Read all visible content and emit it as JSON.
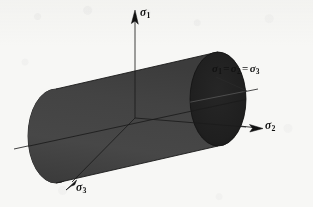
{
  "figure": {
    "name": "von-mises-yield-surface",
    "background_color": "#f7f7f5",
    "ink_color": "#121212",
    "cylinder_body_color": "#434343",
    "cylinder_endcap_color": "#1d1d1d",
    "cylinder_edge_color": "#1a1a1a"
  },
  "labels": {
    "sigma1": {
      "symbol": "σ",
      "subscript": "1"
    },
    "sigma2": {
      "symbol": "σ",
      "subscript": "2"
    },
    "sigma3": {
      "symbol": "σ",
      "subscript": "3"
    },
    "hydrostatic": {
      "symbol": "σ",
      "sub_a": "1",
      "eq1": "=",
      "sub_b": "2",
      "eq2": "=",
      "sub_c": "3",
      "text": "σ1 = σ2 = σ3"
    }
  },
  "geometry": {
    "origin": {
      "x": 135,
      "y": 118
    },
    "axis_sigma1": {
      "from": {
        "x": 135,
        "y": 118
      },
      "to": {
        "x": 135,
        "y": 12
      },
      "arrow": "up"
    },
    "axis_sigma2": {
      "from": {
        "x": 135,
        "y": 118
      },
      "to": {
        "x": 259,
        "y": 127
      },
      "arrow": "right"
    },
    "axis_sigma3": {
      "from": {
        "x": 135,
        "y": 118
      },
      "to": {
        "x": 68,
        "y": 186
      },
      "arrow": "down-left"
    },
    "hydrostatic_axis": {
      "from": {
        "x": 36,
        "y": 144
      },
      "to": {
        "x": 252,
        "y": 98
      },
      "leader_to_label": {
        "x": 214,
        "y": 76
      }
    },
    "cylinder": {
      "near_cap_center": {
        "x": 56,
        "y": 136
      },
      "far_cap_center": {
        "x": 218,
        "y": 99
      },
      "cap_rx": 28,
      "cap_ry": 47,
      "axis_angle_deg": -13
    }
  }
}
